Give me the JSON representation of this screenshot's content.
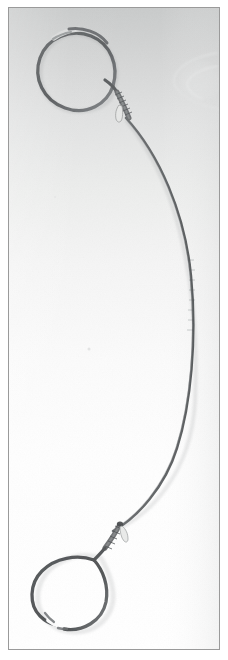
{
  "figure": {
    "domain": "Natural-Image",
    "media_type": "scanned-photograph",
    "caption": "",
    "subject_label": "wire-loop-instrument",
    "canvas": {
      "width": 228,
      "height": 660
    },
    "frame": {
      "label": "photo-border",
      "x": 8,
      "y": 7,
      "width": 212,
      "height": 643,
      "border_color": "#9a9a9a",
      "border_width": 1,
      "outer_margin_color": "#ffffff"
    },
    "background": {
      "label": "paper-background",
      "top_color": "#c9cbcb",
      "upper_mid_color": "#dcdddd",
      "mid_color": "#f1f1f1",
      "bottom_color": "#ffffff",
      "gradient_direction": "top-to-bottom",
      "noise": "fine-scan-grain"
    },
    "object": {
      "name": "double-loop-wire-instrument",
      "description": "Two open wire loops joined by a single long bowed shaft",
      "wire_color_dark": "#5e6163",
      "wire_color_mid": "#7d8082",
      "wire_color_light": "#a9abac",
      "wire_width_loop": 3.2,
      "wire_width_shaft": 2.4,
      "parts": [
        {
          "name": "upper-loop",
          "shape": "tilted-open-ellipse",
          "center": [
            88,
            62
          ],
          "radius_x": 44,
          "radius_y": 34,
          "rotation_deg": -18,
          "gap_start_deg": 214,
          "gap_end_deg": 236,
          "junction": [
            112,
            86
          ]
        },
        {
          "name": "upper-collar",
          "shape": "ribbed-sleeve",
          "x": 118,
          "y": 92,
          "width": 9,
          "height": 26,
          "rotation_deg": 22,
          "rib_count": 7
        },
        {
          "name": "upper-tab",
          "shape": "small-pale-tab",
          "x": 117,
          "y": 106,
          "width": 7,
          "height": 13,
          "color": "#e3e4e3",
          "outline": "#9fa1a1"
        },
        {
          "name": "shaft",
          "shape": "long-bowed-curve",
          "start": [
            124,
            118
          ],
          "control_1": [
            205,
            215
          ],
          "control_2": [
            200,
            420
          ],
          "end": [
            112,
            528
          ],
          "max_right_x": 195,
          "max_right_y": 312
        },
        {
          "name": "lower-collar",
          "shape": "ribbed-sleeve",
          "x": 105,
          "y": 524,
          "width": 9,
          "height": 24,
          "rotation_deg": -22,
          "rib_count": 6
        },
        {
          "name": "lower-tab",
          "shape": "small-pale-tab",
          "x": 112,
          "y": 532,
          "width": 8,
          "height": 12,
          "color": "#e9eae9",
          "outline": "#a3a5a5"
        },
        {
          "name": "lower-loop",
          "shape": "teardrop-open-loop",
          "center": [
            72,
            588
          ],
          "radius_x": 41,
          "radius_y": 36,
          "rotation_deg": 10,
          "junction": [
            98,
            556
          ],
          "gap_start_deg": 104,
          "gap_end_deg": 122
        }
      ]
    },
    "artifacts": [
      {
        "name": "faint-scan-smudge",
        "shape": "soft-curved-streak",
        "x": 172,
        "y": 62,
        "width": 48,
        "height": 42,
        "color": "#e7e8e8",
        "opacity": 0.85
      },
      {
        "name": "faint-speck",
        "shape": "dot",
        "x": 88,
        "y": 348,
        "width": 3,
        "height": 3,
        "color": "#e2e3e3"
      },
      {
        "name": "faint-speck-2",
        "shape": "dot",
        "x": 54,
        "y": 196,
        "width": 2,
        "height": 2,
        "color": "#e5e6e6"
      }
    ]
  }
}
